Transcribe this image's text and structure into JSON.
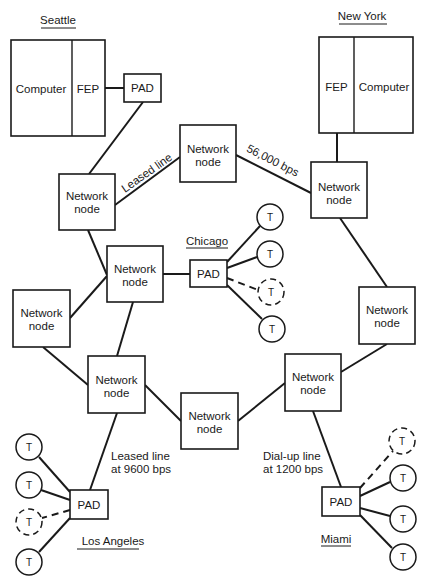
{
  "diagram": {
    "type": "packet-switched network topology",
    "cities": {
      "seattle": {
        "label": "Seattle",
        "host": {
          "computer_label": "Computer",
          "fep_label": "FEP"
        },
        "pad_label": "PAD"
      },
      "new_york": {
        "label": "New York",
        "host": {
          "fep_label": "FEP",
          "computer_label": "Computer"
        }
      },
      "chicago": {
        "label": "Chicago",
        "pad_label": "PAD",
        "terminals": [
          {
            "label": "T",
            "dashed": false
          },
          {
            "label": "T",
            "dashed": false
          },
          {
            "label": "T",
            "dashed": true
          },
          {
            "label": "T",
            "dashed": false
          }
        ]
      },
      "los_angeles": {
        "label": "Los Angeles",
        "pad_label": "PAD",
        "terminals": [
          {
            "label": "T",
            "dashed": false
          },
          {
            "label": "T",
            "dashed": false
          },
          {
            "label": "T",
            "dashed": true
          },
          {
            "label": "T",
            "dashed": false
          }
        ]
      },
      "miami": {
        "label": "Miami",
        "pad_label": "PAD",
        "terminals": [
          {
            "label": "T",
            "dashed": true
          },
          {
            "label": "T",
            "dashed": false
          },
          {
            "label": "T",
            "dashed": false
          },
          {
            "label": "T",
            "dashed": false
          }
        ]
      }
    },
    "network_nodes": [
      {
        "id": "seattle",
        "line1": "Network",
        "line2": "node"
      },
      {
        "id": "top_center",
        "line1": "Network",
        "line2": "node"
      },
      {
        "id": "new_york",
        "line1": "Network",
        "line2": "node"
      },
      {
        "id": "chicago",
        "line1": "Network",
        "line2": "node"
      },
      {
        "id": "left",
        "line1": "Network",
        "line2": "node"
      },
      {
        "id": "right",
        "line1": "Network",
        "line2": "node"
      },
      {
        "id": "los_angeles",
        "line1": "Network",
        "line2": "node"
      },
      {
        "id": "bottom_center",
        "line1": "Network",
        "line2": "node"
      },
      {
        "id": "miami",
        "line1": "Network",
        "line2": "node"
      }
    ],
    "link_labels": {
      "seattle_top": "Leased line",
      "top_newyork": "56,000 bps",
      "la_line1": "Leased line",
      "la_line2": "at 9600 bps",
      "miami_line1": "Dial-up line",
      "miami_line2": "at 1200 bps"
    },
    "colors": {
      "ink": "#1a1a1a",
      "background": "#ffffff"
    }
  }
}
